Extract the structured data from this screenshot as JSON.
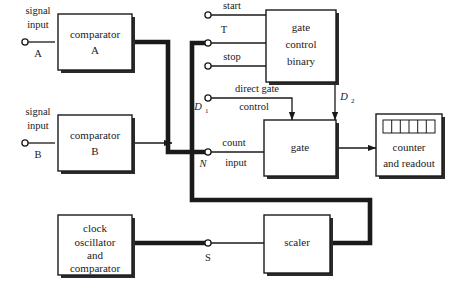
{
  "diagram": {
    "background_color": "#ffffff",
    "line_color": "#1a1a1a",
    "box_fill": "#ffffff",
    "shadow_color": "#2b2b2b"
  },
  "blocks": {
    "comparator_a": {
      "line1": "comparator",
      "line2": "A"
    },
    "comparator_b": {
      "line1": "comparator",
      "line2": "B"
    },
    "gate_control_binary": {
      "line1": "gate",
      "line2": "control",
      "line3": "binary"
    },
    "gate": {
      "line1": "gate"
    },
    "counter_readout": {
      "line1": "counter",
      "line2": "and readout"
    },
    "clock_oscillator": {
      "line1": "clock",
      "line2": "oscillator",
      "line3": "and",
      "line4": "comparator"
    },
    "scaler": {
      "line1": "scaler"
    }
  },
  "input_labels": {
    "signal_input_a": {
      "line1": "signal",
      "line2": "input",
      "line3": "A"
    },
    "signal_input_b": {
      "line1": "signal",
      "line2": "input",
      "line3": "B"
    },
    "start": "start",
    "t_terminal": "T",
    "stop": "stop",
    "direct_gate_control": {
      "line1": "direct gate",
      "line2": "control"
    },
    "count_input": {
      "line1": "count",
      "line2": "input"
    }
  },
  "node_labels": {
    "d1": {
      "base": "D",
      "sub": "1"
    },
    "d2": {
      "base": "D",
      "sub": "2"
    },
    "n": "N",
    "s": "S"
  },
  "counter_display": {
    "cells": 6
  }
}
